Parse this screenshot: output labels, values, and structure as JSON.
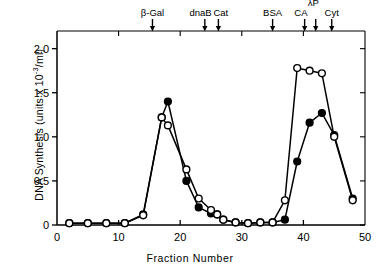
{
  "figure": {
    "xlabel": "Fraction  Number",
    "ylabel_main": "DNA  Synthesis",
    "ylabel_units_pre": "  (units x 10",
    "ylabel_units_exp": "-3",
    "ylabel_units_post": "/ml)"
  },
  "chart_data": {
    "type": "line",
    "title": "",
    "xlabel": "Fraction Number",
    "ylabel": "DNA Synthesis (units x 10-3/ml)",
    "xlim": [
      0,
      50
    ],
    "ylim": [
      0,
      2.2
    ],
    "xticks": [
      0,
      10,
      20,
      30,
      40,
      50
    ],
    "xtick_labels": [
      "0",
      "10",
      "20",
      "30",
      "40",
      "50"
    ],
    "yticks": [
      0,
      0.5,
      1.0,
      1.5,
      2.0
    ],
    "ytick_labels": [
      "0",
      "0.5",
      "1.0",
      "1.5",
      "2.0"
    ],
    "grid": false,
    "legend": "none",
    "markers": [
      {
        "label": "β-Gal",
        "x": 15.5,
        "label_x": 15.5,
        "stacked": false
      },
      {
        "label": "dnaB",
        "x": 24.0,
        "label_x": 23.3,
        "stacked": false
      },
      {
        "label": "Cat",
        "x": 26.2,
        "label_x": 26.6,
        "stacked": false
      },
      {
        "label": "BSA",
        "x": 35.0,
        "label_x": 35.0,
        "stacked": false
      },
      {
        "label": "CA",
        "x": 40.2,
        "label_x": 39.6,
        "stacked": false
      },
      {
        "label": "λP",
        "x": 42.0,
        "label_x": 41.6,
        "stacked": true
      },
      {
        "label": "Cyt",
        "x": 44.6,
        "label_x": 44.6,
        "stacked": false
      }
    ],
    "series": [
      {
        "name": "closed-circles",
        "marker": "filled-circle",
        "x": [
          2,
          5,
          8,
          11,
          14,
          17,
          18,
          21,
          23,
          25,
          26,
          27,
          29,
          31,
          33,
          35,
          37,
          39,
          41,
          43,
          45,
          48
        ],
        "values": [
          0.02,
          0.02,
          0.02,
          0.02,
          0.12,
          1.22,
          1.4,
          0.5,
          0.2,
          0.13,
          0.12,
          0.06,
          0.03,
          0.02,
          0.03,
          0.03,
          0.06,
          0.72,
          1.16,
          1.27,
          1.02,
          0.3
        ]
      },
      {
        "name": "open-circles",
        "marker": "open-circle",
        "x": [
          2,
          5,
          8,
          11,
          14,
          17,
          18,
          21,
          23,
          25,
          26,
          27,
          29,
          31,
          33,
          35,
          37,
          39,
          41,
          43,
          45,
          48
        ],
        "values": [
          0.02,
          0.02,
          0.02,
          0.02,
          0.11,
          1.22,
          1.13,
          0.63,
          0.3,
          0.17,
          0.12,
          0.06,
          0.03,
          0.02,
          0.03,
          0.03,
          0.28,
          1.78,
          1.75,
          1.72,
          1.0,
          0.28
        ]
      }
    ]
  }
}
